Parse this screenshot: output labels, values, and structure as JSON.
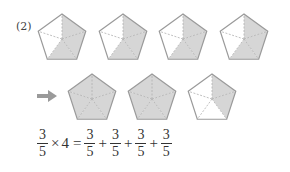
{
  "problem": {
    "label": "(2)",
    "colors": {
      "shade": "#d6d6d6",
      "outline": "#9a9a9a",
      "divider": "#b0b0b0",
      "arrow": "#9a9a9a"
    },
    "top_row": {
      "description": "Four pentagons each divided into 5 equal parts with 3 parts shaded",
      "pentagons": [
        {
          "shaded_parts": 3,
          "total_parts": 5
        },
        {
          "shaded_parts": 3,
          "total_parts": 5
        },
        {
          "shaded_parts": 3,
          "total_parts": 5
        },
        {
          "shaded_parts": 3,
          "total_parts": 5
        }
      ]
    },
    "arrow_icon": "right-arrow",
    "bottom_row": {
      "description": "Regrouped: two fully shaded pentagons and one with 2 of 5 parts shaded",
      "pentagons": [
        {
          "shaded_parts": 5,
          "total_parts": 5
        },
        {
          "shaded_parts": 5,
          "total_parts": 5
        },
        {
          "shaded_parts": 2,
          "total_parts": 5
        }
      ]
    },
    "equation": {
      "lhs_frac": {
        "num": "3",
        "den": "5"
      },
      "times": "×",
      "multiplier": "4",
      "equals": "=",
      "rhs_terms": [
        {
          "num": "3",
          "den": "5"
        },
        {
          "num": "3",
          "den": "5"
        },
        {
          "num": "3",
          "den": "5"
        },
        {
          "num": "3",
          "den": "5"
        }
      ],
      "plus": "+"
    }
  }
}
